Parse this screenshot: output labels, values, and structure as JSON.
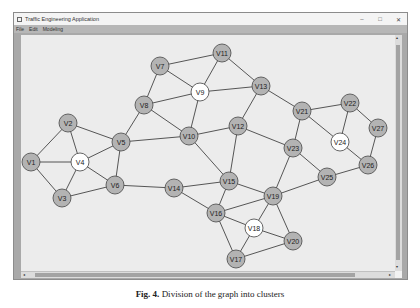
{
  "window": {
    "title": "Traffic Engineering Application",
    "buttons": {
      "minimize": "–",
      "maximize": "□",
      "close": "✕"
    }
  },
  "menu": [
    {
      "label": "File"
    },
    {
      "label": "Edit"
    },
    {
      "label": "Modeling"
    }
  ],
  "colors": {
    "node_fill": "#b3b3b3",
    "highlight_fill": "#ffffff",
    "edge": "#444444",
    "canvas": "#ececec"
  },
  "graph": {
    "nodes": [
      {
        "id": "V1",
        "x": 31,
        "y": 162,
        "highlight": false
      },
      {
        "id": "V2",
        "x": 68,
        "y": 123,
        "highlight": false
      },
      {
        "id": "V3",
        "x": 62,
        "y": 198,
        "highlight": false
      },
      {
        "id": "V4",
        "x": 80,
        "y": 162,
        "highlight": true
      },
      {
        "id": "V5",
        "x": 121,
        "y": 142,
        "highlight": false
      },
      {
        "id": "V6",
        "x": 115,
        "y": 185,
        "highlight": false
      },
      {
        "id": "V7",
        "x": 160,
        "y": 66,
        "highlight": false
      },
      {
        "id": "V8",
        "x": 144,
        "y": 105,
        "highlight": false
      },
      {
        "id": "V9",
        "x": 200,
        "y": 92,
        "highlight": true
      },
      {
        "id": "V10",
        "x": 189,
        "y": 136,
        "highlight": false
      },
      {
        "id": "V11",
        "x": 222,
        "y": 53,
        "highlight": false
      },
      {
        "id": "V12",
        "x": 238,
        "y": 126,
        "highlight": false
      },
      {
        "id": "V13",
        "x": 261,
        "y": 86,
        "highlight": false
      },
      {
        "id": "V14",
        "x": 174,
        "y": 188,
        "highlight": false
      },
      {
        "id": "V15",
        "x": 229,
        "y": 181,
        "highlight": false
      },
      {
        "id": "V16",
        "x": 216,
        "y": 213,
        "highlight": false
      },
      {
        "id": "V17",
        "x": 236,
        "y": 259,
        "highlight": false
      },
      {
        "id": "V18",
        "x": 254,
        "y": 228,
        "highlight": true
      },
      {
        "id": "V19",
        "x": 273,
        "y": 196,
        "highlight": false
      },
      {
        "id": "V20",
        "x": 293,
        "y": 241,
        "highlight": false
      },
      {
        "id": "V21",
        "x": 302,
        "y": 111,
        "highlight": false
      },
      {
        "id": "V22",
        "x": 350,
        "y": 103,
        "highlight": false
      },
      {
        "id": "V23",
        "x": 293,
        "y": 148,
        "highlight": false
      },
      {
        "id": "V24",
        "x": 340,
        "y": 142,
        "highlight": true
      },
      {
        "id": "V25",
        "x": 327,
        "y": 177,
        "highlight": false
      },
      {
        "id": "V26",
        "x": 368,
        "y": 165,
        "highlight": false
      },
      {
        "id": "V27",
        "x": 378,
        "y": 128,
        "highlight": false
      }
    ],
    "edges": [
      [
        "V1",
        "V2"
      ],
      [
        "V1",
        "V3"
      ],
      [
        "V1",
        "V4"
      ],
      [
        "V2",
        "V4"
      ],
      [
        "V2",
        "V5"
      ],
      [
        "V3",
        "V4"
      ],
      [
        "V3",
        "V6"
      ],
      [
        "V4",
        "V5"
      ],
      [
        "V4",
        "V6"
      ],
      [
        "V5",
        "V6"
      ],
      [
        "V5",
        "V8"
      ],
      [
        "V5",
        "V10"
      ],
      [
        "V6",
        "V14"
      ],
      [
        "V7",
        "V11"
      ],
      [
        "V7",
        "V8"
      ],
      [
        "V7",
        "V9"
      ],
      [
        "V8",
        "V9"
      ],
      [
        "V8",
        "V10"
      ],
      [
        "V9",
        "V11"
      ],
      [
        "V9",
        "V10"
      ],
      [
        "V9",
        "V13"
      ],
      [
        "V11",
        "V13"
      ],
      [
        "V10",
        "V12"
      ],
      [
        "V10",
        "V15"
      ],
      [
        "V12",
        "V13"
      ],
      [
        "V12",
        "V15"
      ],
      [
        "V12",
        "V23"
      ],
      [
        "V13",
        "V21"
      ],
      [
        "V14",
        "V15"
      ],
      [
        "V14",
        "V16"
      ],
      [
        "V15",
        "V16"
      ],
      [
        "V15",
        "V19"
      ],
      [
        "V16",
        "V19"
      ],
      [
        "V16",
        "V18"
      ],
      [
        "V16",
        "V17"
      ],
      [
        "V17",
        "V18"
      ],
      [
        "V17",
        "V20"
      ],
      [
        "V18",
        "V19"
      ],
      [
        "V18",
        "V20"
      ],
      [
        "V19",
        "V20"
      ],
      [
        "V19",
        "V23"
      ],
      [
        "V19",
        "V25"
      ],
      [
        "V21",
        "V22"
      ],
      [
        "V21",
        "V23"
      ],
      [
        "V21",
        "V24"
      ],
      [
        "V22",
        "V24"
      ],
      [
        "V22",
        "V27"
      ],
      [
        "V23",
        "V25"
      ],
      [
        "V24",
        "V26"
      ],
      [
        "V25",
        "V26"
      ],
      [
        "V26",
        "V27"
      ]
    ]
  },
  "scrollbars": {
    "left_arrow": "◂",
    "right_arrow": "▸",
    "up_arrow": "▴",
    "down_arrow": "▾"
  },
  "caption": {
    "label": "Fig. 4.",
    "text": "Division of the graph into clusters"
  }
}
